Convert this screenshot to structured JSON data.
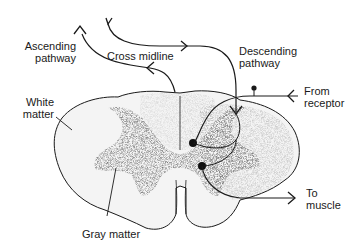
{
  "diagram": {
    "labels": {
      "ascending_line1": "Ascending",
      "ascending_line2": "pathway",
      "cross_midline": "Cross midline",
      "descending_line1": "Descending",
      "descending_line2": "pathway",
      "white_line1": "White",
      "white_line2": "matter",
      "from_line1": "From",
      "from_line2": "receptor",
      "gray_matter": "Gray matter",
      "to_line1": "To",
      "to_line2": "muscle"
    },
    "colors": {
      "ink": "#1a1a1a",
      "white_matter": "#f2f2f2",
      "gray_matter": "#6e6e6e",
      "background": "#ffffff"
    }
  }
}
